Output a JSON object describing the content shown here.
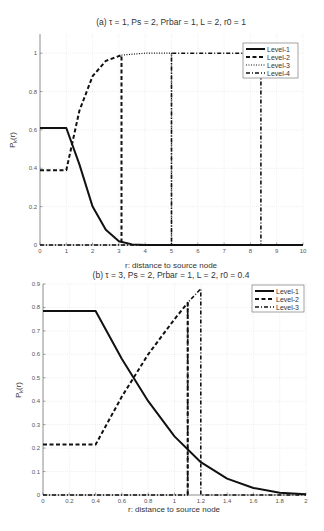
{
  "chart_data": [
    {
      "type": "line",
      "title": "(a) τ = 1, Ps = 2, Prbar = 1, L = 2, r0 = 1",
      "xlabel": "r: distance to source node",
      "ylabel": "P_k(r)",
      "xlim": [
        0,
        10
      ],
      "ylim": [
        0,
        1.1
      ],
      "xticks": [
        "0",
        "1",
        "2",
        "3",
        "4",
        "5",
        "6",
        "7",
        "8",
        "9",
        "10"
      ],
      "yticks": [
        "0",
        "0.2",
        "0.4",
        "0.6",
        "0.8",
        "1"
      ],
      "grid": true,
      "legend_position": "upper right",
      "series": [
        {
          "name": "Level-1",
          "style": "solid",
          "x": [
            0,
            1,
            1.5,
            2,
            2.5,
            3,
            3.5,
            4,
            10
          ],
          "y": [
            0.61,
            0.61,
            0.42,
            0.2,
            0.08,
            0.02,
            0.003,
            0,
            0
          ]
        },
        {
          "name": "Level-2",
          "style": "dashed",
          "x": [
            0,
            1,
            1.5,
            2,
            2.5,
            3.1,
            3.1
          ],
          "y": [
            0.39,
            0.39,
            0.7,
            0.88,
            0.96,
            0.99,
            0
          ]
        },
        {
          "name": "Level-3",
          "style": "dotted",
          "x": [
            3.1,
            4,
            5,
            5
          ],
          "y": [
            0.99,
            1.0,
            1.0,
            0
          ]
        },
        {
          "name": "Level-4",
          "style": "dashdot",
          "x": [
            0,
            5,
            5,
            8.4,
            8.4
          ],
          "y": [
            0,
            0,
            1.0,
            1.0,
            0
          ]
        }
      ]
    },
    {
      "type": "line",
      "title": "(b)  τ = 3, Ps = 2, Prbar = 1, L = 2, r0 = 0.4",
      "xlabel": "r: distance to source node",
      "ylabel": "P_k(r)",
      "xlim": [
        0,
        2
      ],
      "ylim": [
        0,
        0.9
      ],
      "xticks": [
        "0",
        "0.2",
        "0.4",
        "0.6",
        "0.8",
        "1",
        "1.2",
        "1.4",
        "1.6",
        "1.8",
        "2"
      ],
      "yticks": [
        "0",
        "0.1",
        "0.2",
        "0.3",
        "0.4",
        "0.5",
        "0.6",
        "0.7",
        "0.8",
        "0.9"
      ],
      "grid": true,
      "legend_position": "upper right",
      "series": [
        {
          "name": "Level-1",
          "style": "solid",
          "x": [
            0,
            0.4,
            0.6,
            0.8,
            1.0,
            1.2,
            1.4,
            1.6,
            1.8,
            2.0
          ],
          "y": [
            0.785,
            0.785,
            0.58,
            0.4,
            0.25,
            0.14,
            0.07,
            0.03,
            0.01,
            0.003
          ]
        },
        {
          "name": "Level-2",
          "style": "dashed",
          "x": [
            0,
            0.4,
            0.6,
            0.8,
            1.0,
            1.1,
            1.1
          ],
          "y": [
            0.215,
            0.215,
            0.42,
            0.6,
            0.75,
            0.82,
            0
          ]
        },
        {
          "name": "Level-3",
          "style": "dashdot",
          "x": [
            0,
            1.1,
            1.1,
            1.2,
            1.2,
            2.0
          ],
          "y": [
            0,
            0,
            0.82,
            0.88,
            0,
            0
          ]
        }
      ]
    }
  ]
}
